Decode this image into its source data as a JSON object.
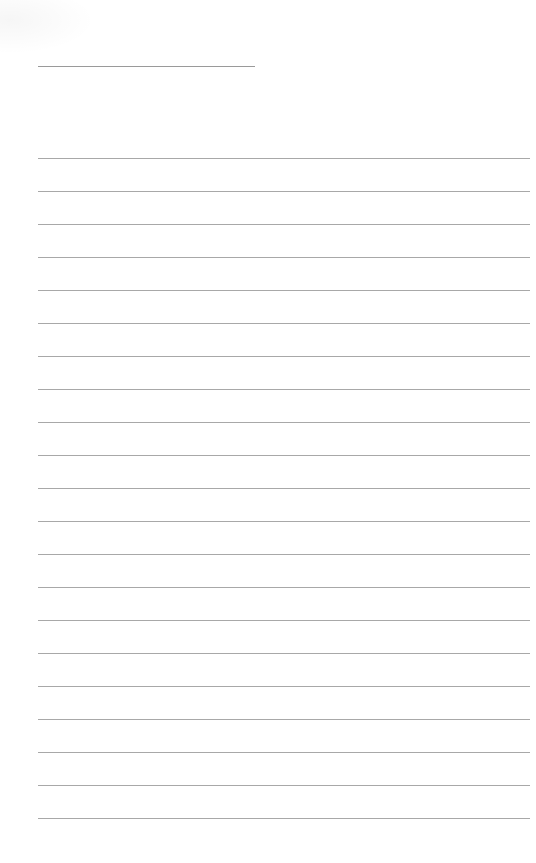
{
  "page": {
    "type": "lined-paper",
    "background_color": "#ffffff",
    "line_color": "#a8a8a8",
    "header_line": {
      "left": 38,
      "top": 66,
      "width": 217,
      "color": "#9a9a9a"
    },
    "ruled_lines": {
      "count": 21,
      "first_top": 158,
      "spacing": 33,
      "left": 38,
      "width": 492
    },
    "text": []
  }
}
